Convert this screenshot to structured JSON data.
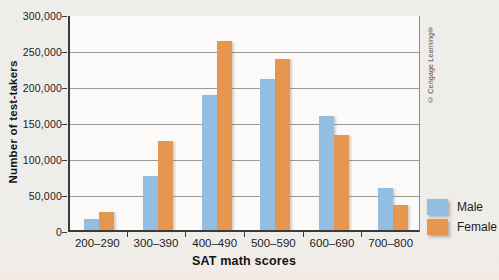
{
  "figure": {
    "copyright": "© Cengage Learning®"
  },
  "chart_data": {
    "type": "bar",
    "title": "",
    "xlabel": "SAT math scores",
    "ylabel": "Number of test-takers",
    "categories": [
      "200–290",
      "300–390",
      "400–490",
      "500–590",
      "600–690",
      "700–800"
    ],
    "series": [
      {
        "name": "Male",
        "color": "#92bee1",
        "values": [
          15000,
          75000,
          187000,
          210000,
          158000,
          58000
        ]
      },
      {
        "name": "Female",
        "color": "#e6964f",
        "values": [
          25000,
          123000,
          263000,
          237000,
          132000,
          35000
        ]
      }
    ],
    "ylim": [
      0,
      300000
    ],
    "ytick_interval": 50000,
    "ytick_labels": [
      "0",
      "50,000",
      "100,000",
      "150,000",
      "200,000",
      "250,000",
      "300,000"
    ],
    "grid": true,
    "legend_position": "right-bottom"
  }
}
